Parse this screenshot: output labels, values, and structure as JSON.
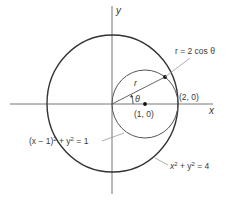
{
  "figure": {
    "axes": {
      "x_label": "x",
      "y_label": "y"
    },
    "points": [
      {
        "name": "center",
        "label": "(1, 0)",
        "x": 1,
        "y": 0
      },
      {
        "name": "tangent-point",
        "label": "(2, 0)",
        "x": 2,
        "y": 0
      }
    ],
    "curves": [
      {
        "name": "small-circle",
        "equation": "(x − 1)² + y² = 1",
        "center": [
          1,
          0
        ],
        "radius": 1
      },
      {
        "name": "large-circle",
        "equation": "x² + y² = 4",
        "center": [
          0,
          0
        ],
        "radius": 2
      }
    ],
    "labels": {
      "polar_equation": "r = 2 cos θ",
      "radius": "r",
      "angle": "θ",
      "center_point": "(1, 0)",
      "tangent_point": "(2, 0)",
      "small_circle_eq_lhs": "(x − 1)",
      "small_circle_eq_rhs": " + y",
      "small_circle_eq_end": " = 1",
      "large_circle_eq_a": "x",
      "large_circle_eq_b": " + y",
      "large_circle_eq_c": " = 4",
      "sup2": "2"
    },
    "colors": {
      "stroke": "#3a3a3a",
      "axis": "#555555",
      "leader": "#8a8a8a"
    }
  }
}
